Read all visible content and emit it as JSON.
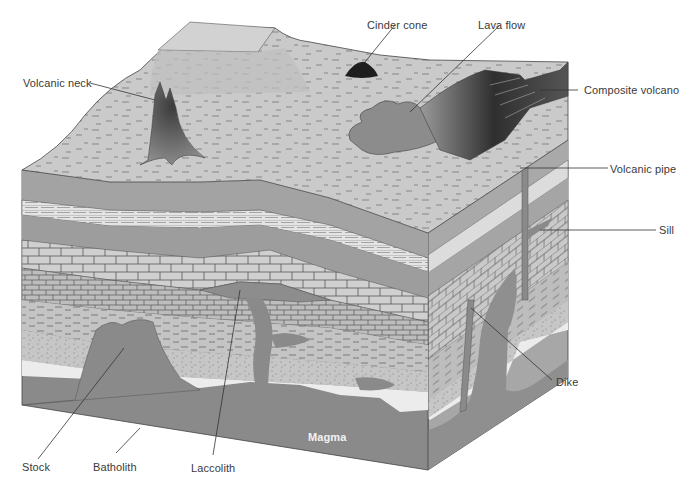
{
  "figure": {
    "colors": {
      "background": "#ffffff",
      "surface": "#c9c9c9",
      "magma": "#8a8a8a",
      "layer_dark": "#9d9d9d",
      "layer_light": "#d2d2d2",
      "side_face": "#a9a9a9",
      "sand_white": "#ececec",
      "label_text": "#3a3a3a",
      "leader_line": "#333333"
    }
  },
  "labels": {
    "volcanic_neck": "Volcanic neck",
    "cinder_cone": "Cinder cone",
    "lava_flow": "Lava flow",
    "composite_volcano": "Composite volcano",
    "volcanic_pipe": "Volcanic pipe",
    "sill": "Sill",
    "dike": "Dike",
    "magma": "Magma",
    "stock": "Stock",
    "batholith": "Batholith",
    "laccolith": "Laccolith"
  }
}
